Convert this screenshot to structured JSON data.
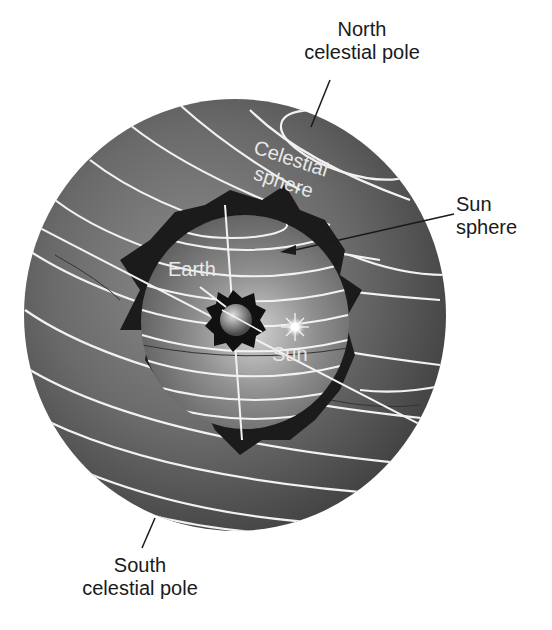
{
  "labels": {
    "north_pole": {
      "line1": "North",
      "line2": "celestial pole"
    },
    "south_pole": {
      "line1": "South",
      "line2": "celestial pole"
    },
    "sun_sphere": {
      "line1": "Sun",
      "line2": "sphere"
    },
    "celestial_sphere": {
      "line1": "Celestial",
      "line2": "sphere"
    },
    "earth": "Earth",
    "sun": "Sun"
  },
  "colors": {
    "background": "#ffffff",
    "celestial_sphere": "#5a5a5a",
    "celestial_sphere_highlight": "#8a8a8a",
    "sun_sphere": "#7d7d7d",
    "sun_sphere_highlight": "#c8c8c8",
    "shadow": "#1b1b1b",
    "circle_lines": "#f2f2f2",
    "label_text": "#1a1a1a"
  }
}
